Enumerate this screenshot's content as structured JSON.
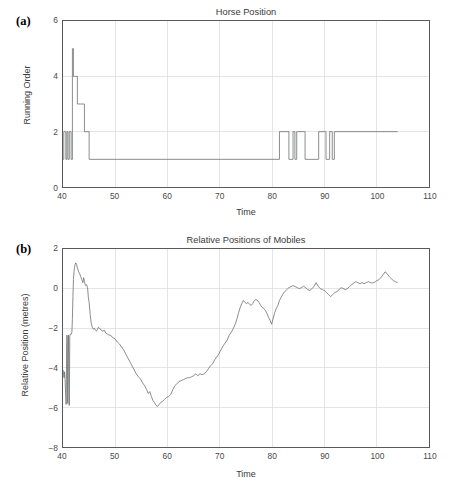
{
  "figure": {
    "background": "#ffffff",
    "line_color": "#76777a",
    "grid_color": "#d9d9d9",
    "axis_color": "#58595b"
  },
  "panels": [
    {
      "label": "(a)",
      "title": "Horse Position"
    },
    {
      "label": "(b)",
      "title": "Relative Positions of Mobiles"
    }
  ],
  "chart_data": [
    {
      "type": "line",
      "title": "Horse Position",
      "subtitle": "(a)",
      "xlabel": "Time",
      "ylabel": "Running Order",
      "xlim": [
        40,
        110
      ],
      "ylim": [
        0,
        6
      ],
      "xticks": [
        40,
        50,
        60,
        70,
        80,
        90,
        100,
        110
      ],
      "yticks": [
        0,
        2,
        4,
        6
      ],
      "xticklabels": [
        "40",
        "50",
        "60",
        "70",
        "80",
        "90",
        "100",
        "110"
      ],
      "yticklabels": [
        "0",
        "2",
        "4",
        "6"
      ],
      "grid": true,
      "legend": false,
      "drawstyle": "steps-post",
      "series": [
        {
          "name": "running order",
          "x": [
            40.0,
            40.15,
            40.15,
            40.55,
            40.55,
            40.75,
            40.75,
            40.95,
            40.95,
            41.2,
            41.2,
            41.55,
            41.55,
            41.8,
            41.8,
            42.0,
            42.0,
            42.35,
            42.35,
            42.75,
            42.75,
            43.35,
            43.35,
            44.1,
            44.1,
            45.0,
            45.0,
            81.4,
            81.4,
            83.2,
            83.2,
            84.0,
            84.0,
            84.35,
            84.35,
            84.7,
            84.7,
            85.1,
            85.1,
            86.3,
            86.3,
            88.9,
            88.9,
            90.3,
            90.3,
            91.0,
            91.0,
            91.5,
            91.5,
            91.9,
            91.9,
            92.4,
            92.4,
            104.0
          ],
          "y": [
            1,
            1,
            2,
            2,
            1,
            1,
            2,
            2,
            1,
            1,
            2,
            2,
            1,
            1,
            5,
            5,
            4,
            4,
            4,
            4,
            3,
            3,
            3,
            3,
            2,
            2,
            1,
            1,
            2,
            2,
            1,
            1,
            2,
            2,
            1,
            1,
            2,
            2,
            2,
            2,
            1,
            1,
            2,
            2,
            1,
            1,
            2,
            2,
            1,
            1,
            2,
            2,
            2,
            2
          ]
        }
      ]
    },
    {
      "type": "line",
      "title": "Relative Positions of Mobiles",
      "subtitle": "(b)",
      "xlabel": "Time",
      "ylabel": "Relative Position (metres)",
      "xlim": [
        40,
        110
      ],
      "ylim": [
        -8,
        2
      ],
      "xticks": [
        40,
        50,
        60,
        70,
        80,
        90,
        100,
        110
      ],
      "yticks": [
        -8,
        -6,
        -4,
        -2,
        0,
        2
      ],
      "xticklabels": [
        "40",
        "50",
        "60",
        "70",
        "80",
        "90",
        "100",
        "110"
      ],
      "yticklabels": [
        "−8",
        "−6",
        "−4",
        "−2",
        "0",
        "2"
      ],
      "grid": true,
      "legend": false,
      "drawstyle": "default",
      "series": [
        {
          "name": "relative position",
          "x": [
            40.0,
            40.1,
            40.2,
            40.3,
            40.4,
            40.5,
            40.6,
            40.65,
            40.7,
            40.75,
            40.8,
            40.85,
            40.9,
            40.95,
            41.0,
            41.05,
            41.1,
            41.15,
            41.2,
            41.25,
            41.3,
            41.4,
            41.5,
            41.6,
            41.7,
            41.8,
            41.9,
            42.0,
            42.1,
            42.2,
            42.3,
            42.45,
            42.6,
            42.8,
            43.0,
            43.2,
            43.4,
            43.6,
            43.8,
            43.95,
            44.1,
            44.3,
            44.5,
            44.7,
            44.85,
            45.0,
            45.2,
            45.4,
            45.6,
            45.8,
            46.0,
            46.2,
            46.4,
            46.6,
            46.8,
            47.0,
            47.3,
            47.6,
            47.9,
            48.2,
            48.5,
            48.8,
            49.1,
            49.4,
            49.7,
            50.0,
            50.4,
            50.8,
            51.2,
            51.6,
            52.0,
            52.4,
            52.8,
            53.2,
            53.6,
            54.0,
            54.4,
            54.8,
            55.2,
            55.6,
            56.0,
            56.3,
            56.6,
            56.9,
            57.2,
            57.5,
            57.8,
            58.1,
            58.4,
            58.7,
            59.0,
            59.4,
            59.8,
            60.2,
            60.6,
            61.0,
            61.4,
            61.8,
            62.2,
            62.6,
            63.0,
            63.4,
            63.8,
            64.2,
            64.6,
            65.0,
            65.4,
            65.8,
            66.2,
            66.6,
            67.0,
            67.4,
            67.8,
            68.2,
            68.6,
            69.0,
            69.4,
            69.8,
            70.2,
            70.6,
            71.0,
            71.4,
            71.8,
            72.2,
            72.6,
            73.0,
            73.3,
            73.6,
            73.9,
            74.2,
            74.5,
            74.8,
            75.1,
            75.4,
            75.7,
            76.0,
            76.3,
            76.6,
            76.9,
            77.2,
            77.5,
            77.8,
            78.1,
            78.4,
            78.7,
            79.0,
            79.3,
            79.6,
            79.9,
            80.2,
            80.5,
            80.8,
            81.1,
            81.4,
            81.7,
            82.0,
            82.4,
            82.8,
            83.2,
            83.6,
            84.0,
            84.4,
            84.8,
            85.2,
            85.6,
            86.0,
            86.4,
            86.8,
            87.2,
            87.6,
            88.0,
            88.4,
            88.8,
            89.2,
            89.6,
            90.0,
            90.4,
            90.8,
            91.2,
            91.6,
            92.0,
            92.4,
            92.8,
            93.2,
            93.6,
            94.0,
            94.4,
            94.8,
            95.2,
            95.6,
            96.0,
            96.4,
            96.8,
            97.2,
            97.6,
            98.0,
            98.4,
            98.8,
            99.2,
            99.6,
            100.0,
            100.4,
            100.8,
            101.2,
            101.6,
            102.0,
            102.4,
            102.8,
            103.2,
            103.6,
            104.0
          ],
          "y": [
            -4.1,
            -4.25,
            -4.5,
            -4.2,
            -4.6,
            -5.3,
            -5.85,
            -4.6,
            -3.0,
            -2.35,
            -2.6,
            -4.4,
            -5.8,
            -4.5,
            -2.6,
            -2.35,
            -3.6,
            -5.3,
            -5.9,
            -4.2,
            -2.4,
            -2.3,
            -2.3,
            -2.3,
            -2.2,
            -1.5,
            -0.4,
            0.45,
            0.85,
            1.05,
            1.2,
            1.3,
            1.22,
            1.0,
            0.85,
            0.75,
            0.6,
            0.45,
            0.3,
            0.55,
            0.35,
            0.15,
            0.2,
            0.05,
            -0.45,
            -0.7,
            -1.3,
            -1.75,
            -1.95,
            -2.05,
            -2.0,
            -2.1,
            -2.15,
            -2.05,
            -1.95,
            -2.0,
            -2.1,
            -2.15,
            -2.1,
            -2.25,
            -2.3,
            -2.35,
            -2.35,
            -2.45,
            -2.5,
            -2.55,
            -2.7,
            -2.8,
            -2.95,
            -3.1,
            -3.3,
            -3.5,
            -3.7,
            -3.9,
            -4.1,
            -4.3,
            -4.45,
            -4.55,
            -4.75,
            -4.9,
            -5.1,
            -5.3,
            -5.2,
            -5.45,
            -5.65,
            -5.75,
            -5.9,
            -5.95,
            -5.85,
            -5.75,
            -5.7,
            -5.6,
            -5.5,
            -5.45,
            -5.35,
            -5.1,
            -4.9,
            -4.8,
            -4.7,
            -4.65,
            -4.6,
            -4.55,
            -4.5,
            -4.5,
            -4.45,
            -4.4,
            -4.3,
            -4.4,
            -4.3,
            -4.35,
            -4.3,
            -4.2,
            -4.05,
            -3.9,
            -3.8,
            -3.6,
            -3.45,
            -3.3,
            -3.1,
            -2.9,
            -2.75,
            -2.6,
            -2.35,
            -2.2,
            -2.0,
            -1.75,
            -1.5,
            -1.2,
            -0.95,
            -0.75,
            -0.6,
            -0.7,
            -0.75,
            -0.7,
            -0.8,
            -0.85,
            -0.75,
            -0.6,
            -0.55,
            -0.6,
            -0.7,
            -0.85,
            -0.95,
            -1.0,
            -1.1,
            -1.25,
            -1.45,
            -1.6,
            -1.8,
            -1.5,
            -1.2,
            -1.0,
            -0.85,
            -0.6,
            -0.45,
            -0.3,
            -0.15,
            -0.05,
            0.05,
            0.1,
            0.15,
            0.1,
            0.05,
            0.0,
            0.05,
            0.12,
            0.05,
            -0.05,
            -0.1,
            0.0,
            0.1,
            0.3,
            0.12,
            0.0,
            -0.05,
            -0.1,
            -0.2,
            -0.3,
            -0.4,
            -0.3,
            -0.2,
            -0.15,
            -0.05,
            0.05,
            0.0,
            -0.05,
            0.0,
            0.1,
            0.2,
            0.28,
            0.35,
            0.3,
            0.25,
            0.3,
            0.25,
            0.3,
            0.35,
            0.3,
            0.28,
            0.32,
            0.4,
            0.45,
            0.55,
            0.7,
            0.85,
            0.75,
            0.6,
            0.5,
            0.4,
            0.35,
            0.3,
            0.25,
            0.15,
            0.08,
            0.02
          ]
        }
      ]
    }
  ]
}
